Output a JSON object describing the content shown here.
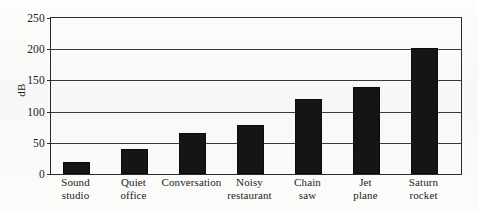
{
  "chart_data": {
    "type": "bar",
    "title": "",
    "xlabel": "",
    "ylabel": "dB",
    "ylim": [
      0,
      250
    ],
    "yticks": [
      0,
      50,
      100,
      150,
      200,
      250
    ],
    "ytick_labels": [
      "0",
      "50",
      "100",
      "150",
      "200",
      "250"
    ],
    "grid": true,
    "legend": false,
    "orientation": "vertical",
    "bar_color": "#151515",
    "categories": [
      "Sound studio",
      "Quiet office",
      "Conversation",
      "Noisy restaurant",
      "Chain saw",
      "Jet plane",
      "Saturn rocket"
    ],
    "category_lines": [
      [
        "Sound",
        "studio"
      ],
      [
        "Quiet",
        "office"
      ],
      [
        "Conversation",
        ""
      ],
      [
        "Noisy",
        "restaurant"
      ],
      [
        "Chain",
        "saw"
      ],
      [
        "Jet",
        "plane"
      ],
      [
        "Saturn",
        "rocket"
      ]
    ],
    "values": [
      20,
      40,
      65,
      78,
      120,
      140,
      202
    ]
  },
  "figure": {
    "axis_color": "#2b2b2b",
    "grid_color": "#3a3a3a",
    "background": "#fbfbfa"
  }
}
